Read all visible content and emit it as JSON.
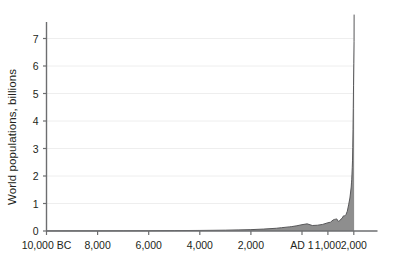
{
  "chart_data": {
    "type": "area",
    "title": "",
    "subtitle": "",
    "xlabel": "",
    "ylabel": "World populations, billions",
    "ylim": [
      0,
      7.6
    ],
    "yticks": [
      0,
      1,
      2,
      3,
      4,
      5,
      6,
      7
    ],
    "ytick_labels": [
      "0",
      "1",
      "2",
      "3",
      "4",
      "5",
      "6",
      "7"
    ],
    "xtick_labels": [
      "10,000 BC",
      "8,000",
      "6,000",
      "4,000",
      "2,000",
      "AD 1",
      "1,000",
      "2,000"
    ],
    "xtick_years": [
      -10000,
      -8000,
      -6000,
      -4000,
      -2000,
      1,
      1000,
      2000
    ],
    "grid": true,
    "grid_axis": "y",
    "legend": "none",
    "series": [
      {
        "name": "World population",
        "units": "billions",
        "fill_color": "#8e8e8e",
        "line_color": "#58585a",
        "x": [
          -10000,
          -9000,
          -8000,
          -7000,
          -6000,
          -5000,
          -4000,
          -3000,
          -2500,
          -2000,
          -1500,
          -1000,
          -800,
          -500,
          -400,
          -200,
          1,
          200,
          400,
          600,
          800,
          1000,
          1100,
          1200,
          1250,
          1300,
          1340,
          1400,
          1450,
          1500,
          1550,
          1600,
          1650,
          1700,
          1750,
          1800,
          1850,
          1900,
          1910,
          1920,
          1930,
          1940,
          1950,
          1960,
          1970,
          1980,
          1990,
          2000,
          2010
        ],
        "y": [
          0.004,
          0.005,
          0.005,
          0.007,
          0.01,
          0.015,
          0.02,
          0.03,
          0.04,
          0.05,
          0.07,
          0.1,
          0.12,
          0.15,
          0.16,
          0.19,
          0.23,
          0.26,
          0.2,
          0.21,
          0.24,
          0.3,
          0.32,
          0.4,
          0.42,
          0.43,
          0.44,
          0.35,
          0.37,
          0.43,
          0.46,
          0.55,
          0.55,
          0.6,
          0.72,
          0.95,
          1.2,
          1.6,
          1.75,
          1.86,
          2.07,
          2.3,
          2.55,
          3.03,
          3.7,
          4.45,
          5.3,
          6.1,
          6.9
        ]
      }
    ]
  },
  "axis": {
    "y_title": "World populations, billions"
  }
}
